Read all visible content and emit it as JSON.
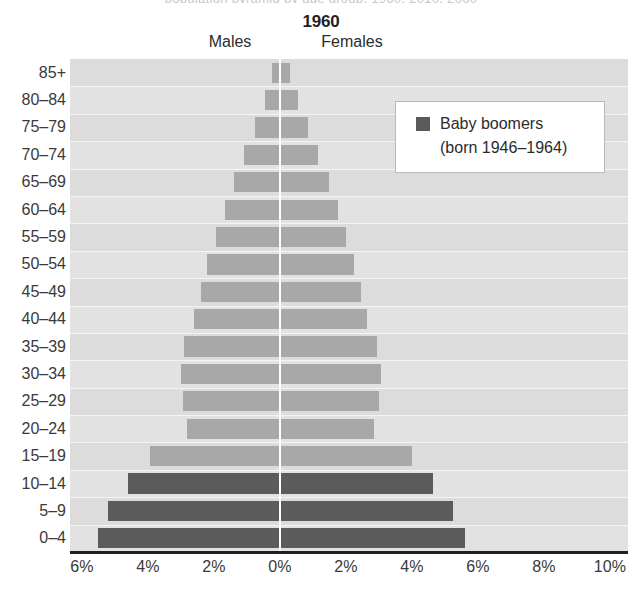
{
  "top_caption_fragment": "population pyramid by age group, 1960, 2010, 2060",
  "chart_data": {
    "type": "bar",
    "subtype": "population-pyramid",
    "title": "1960",
    "xlabel": "",
    "ylabel": "",
    "grid": true,
    "legend_position": "top-right",
    "categories": [
      "85+",
      "80–84",
      "75–79",
      "70–74",
      "65–69",
      "60–64",
      "55–59",
      "50–54",
      "45–49",
      "40–44",
      "35–39",
      "30–34",
      "25–29",
      "20–24",
      "15–19",
      "10–14",
      "5–9",
      "0–4"
    ],
    "series": [
      {
        "name": "Males",
        "side": "left",
        "values": [
          0.25,
          0.45,
          0.75,
          1.1,
          1.4,
          1.65,
          1.95,
          2.2,
          2.4,
          2.6,
          2.9,
          3.0,
          2.95,
          2.8,
          3.95,
          4.6,
          5.2,
          5.5
        ]
      },
      {
        "name": "Females",
        "side": "right",
        "values": [
          0.3,
          0.55,
          0.85,
          1.15,
          1.5,
          1.75,
          2.0,
          2.25,
          2.45,
          2.65,
          2.95,
          3.05,
          3.0,
          2.85,
          4.0,
          4.65,
          5.25,
          5.6
        ]
      }
    ],
    "baby_boomer_categories": [
      "10–14",
      "5–9",
      "0–4"
    ],
    "x_axis": {
      "tick_labels": [
        "6%",
        "4%",
        "2%",
        "0%",
        "2%",
        "4%",
        "6%",
        "8%",
        "10%"
      ],
      "tick_values": [
        -6,
        -4,
        -2,
        0,
        2,
        4,
        6,
        8,
        10
      ],
      "min": -6.36,
      "max": 10.55,
      "unit": "%"
    },
    "colors": {
      "bar_light": "#a8a8a8",
      "bar_dark": "#5b5b5b",
      "plot_background": "#dcdcdc",
      "gridline": "#f4f4f4",
      "centerline": "#ffffff",
      "axis": "#231f20",
      "text": "#3a3a3a"
    }
  },
  "labels": {
    "males": "Males",
    "females": "Females"
  },
  "legend": {
    "title": "Baby boomers",
    "subtitle": "(born 1946–1964)",
    "swatch_color": "#5b5b5b"
  }
}
